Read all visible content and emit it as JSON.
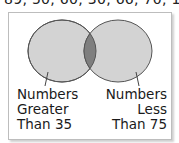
{
  "top_text": "89, 50, 60, 30, 66, 70, 100",
  "venn": {
    "left_set": {
      "label_lines": [
        "Numbers",
        "Greater",
        "Than 35"
      ],
      "fill": "#d3d3d3"
    },
    "right_set": {
      "label_lines": [
        "Numbers",
        "Less",
        "Than 75"
      ],
      "fill": "#d3d3d3"
    },
    "intersection_fill": "#7f7f7f",
    "stroke": "#555555"
  }
}
